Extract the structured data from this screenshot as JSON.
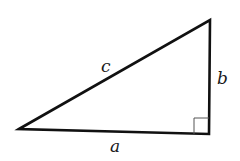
{
  "diagram": {
    "type": "right-triangle",
    "colors": {
      "stroke": "#111111",
      "right_angle_marker": "#555555",
      "background": "#ffffff"
    },
    "vertices": {
      "left": [
        19,
        129
      ],
      "top_right": [
        210,
        20
      ],
      "bottom_right": [
        209,
        134
      ]
    },
    "right_angle_at": "bottom_right",
    "labels": {
      "hypotenuse": "c",
      "vertical_leg": "b",
      "horizontal_leg": "a"
    }
  }
}
